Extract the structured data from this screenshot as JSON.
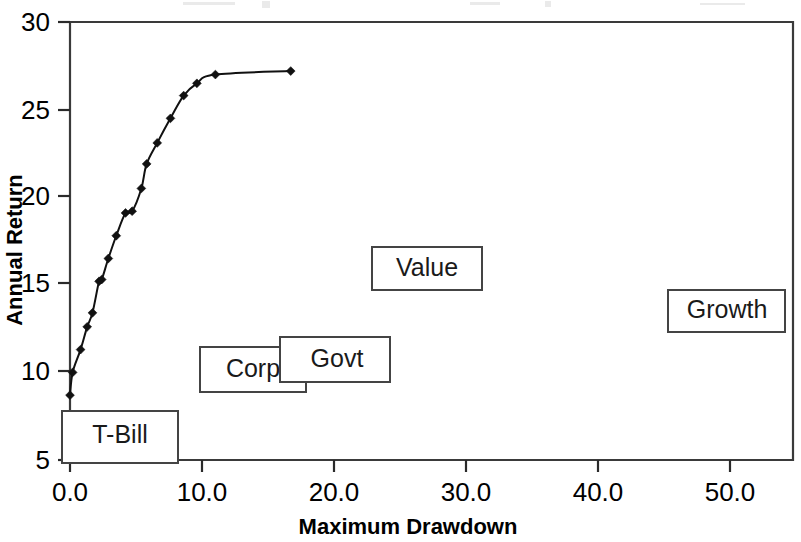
{
  "figure": {
    "background_color": "#ffffff",
    "ink_color": "#111111",
    "frame_color": "#3a3a3a"
  },
  "chart_data": {
    "type": "line",
    "title": "",
    "subtitle": "",
    "xlabel": "Maximum Drawdown",
    "ylabel": "Annual Return",
    "xlim": [
      0.0,
      54.7
    ],
    "ylim": [
      5,
      30
    ],
    "xticks": [
      0.0,
      10.0,
      20.0,
      30.0,
      40.0,
      50.0
    ],
    "xticklabels": [
      "0.0",
      "10.0",
      "20.0",
      "30.0",
      "40.0",
      "50.0"
    ],
    "yticks": [
      5,
      10,
      15,
      20,
      25,
      30
    ],
    "yticklabels": [
      "5",
      "10",
      "15",
      "20",
      "25",
      "30"
    ],
    "grid": false,
    "legend": false,
    "legend_position": "none",
    "markers": "filled-diamond",
    "series": [
      {
        "name": "Efficient frontier",
        "x": [
          0.0,
          0.2,
          0.8,
          1.3,
          1.7,
          2.2,
          2.4,
          2.9,
          3.5,
          4.2,
          4.7,
          5.4,
          5.8,
          6.6,
          7.6,
          8.6,
          9.6,
          11.0,
          16.7
        ],
        "y": [
          8.7,
          10.0,
          11.3,
          12.6,
          13.4,
          15.2,
          15.3,
          16.5,
          17.8,
          19.1,
          19.2,
          20.5,
          21.9,
          23.1,
          24.5,
          25.8,
          26.5,
          27.0,
          27.2
        ]
      }
    ],
    "annotations": [
      {
        "label": "T-Bill",
        "kind": "callout-box",
        "x_data": 0.3,
        "y_data": 6.6,
        "x_px": 62,
        "y_px": 411,
        "width_px": 116,
        "height_px": 52
      },
      {
        "label": "Corp",
        "kind": "callout-box",
        "x_data": 10.0,
        "y_data": 9.6,
        "x_px": 200,
        "y_px": 347,
        "width_px": 106,
        "height_px": 45
      },
      {
        "label": "Govt",
        "kind": "callout-box",
        "x_data": 16.0,
        "y_data": 10.2,
        "x_px": 280,
        "y_px": 337,
        "width_px": 110,
        "height_px": 45
      },
      {
        "label": "Value",
        "kind": "callout-box",
        "x_data": 23.0,
        "y_data": 16.8,
        "x_px": 372,
        "y_px": 247,
        "width_px": 110,
        "height_px": 43
      },
      {
        "label": "Growth",
        "kind": "callout-box",
        "x_data": 45.5,
        "y_data": 14.4,
        "x_px": 668,
        "y_px": 290,
        "width_px": 117,
        "height_px": 42
      }
    ]
  }
}
